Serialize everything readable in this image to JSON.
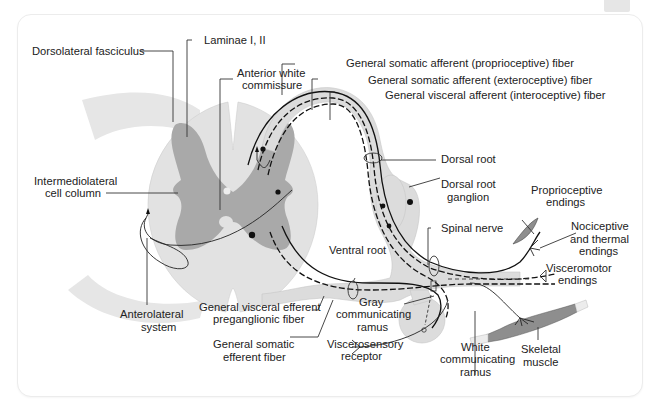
{
  "figure": {
    "colors": {
      "white_matter": "#e2e2e2",
      "gray_matter": "#a9a9a9",
      "nerve_sheath": "#dcdcdc",
      "muscle": "#8e8e8e",
      "fiber": "#111111",
      "card_border": "#ececec"
    },
    "labels": {
      "dorsolateral_fasciculus": "Dorsolateral fasciculus",
      "laminae": "Laminae I, II",
      "anterior_white_commissure_1": "Anterior white",
      "anterior_white_commissure_2": "commissure",
      "gsa_proprioceptive": "General somatic afferent (proprioceptive) fiber",
      "gsa_exteroceptive": "General somatic afferent (exteroceptive) fiber",
      "gva_interoceptive": "General visceral afferent (interoceptive) fiber",
      "dorsal_root": "Dorsal root",
      "drg_1": "Dorsal root",
      "drg_2": "ganglion",
      "proprioceptive_endings_1": "Proprioceptive",
      "proprioceptive_endings_2": "endings",
      "intermediolateral_1": "Intermediolateral",
      "intermediolateral_2": "cell column",
      "spinal_nerve": "Spinal nerve",
      "nociceptive_1": "Nociceptive",
      "nociceptive_2": "and thermal",
      "nociceptive_3": "endings",
      "ventral_root": "Ventral root",
      "visceromotor_1": "Visceromotor",
      "visceromotor_2": "endings",
      "anterolateral_1": "Anterolateral",
      "anterolateral_2": "system",
      "gve_1": "General visceral efferent",
      "gve_2": "preganglionic fiber",
      "gray_ramus_1": "Gray",
      "gray_ramus_2": "communicating",
      "gray_ramus_3": "ramus",
      "gse_1": "General somatic",
      "gse_2": "efferent fiber",
      "viscerosensory_1": "Viscerosensory",
      "viscerosensory_2": "receptor",
      "white_ramus_1": "White",
      "white_ramus_2": "communicating",
      "white_ramus_3": "ramus",
      "skeletal_muscle_1": "Skeletal",
      "skeletal_muscle_2": "muscle"
    }
  }
}
